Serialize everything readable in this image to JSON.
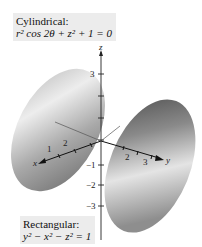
{
  "figure": {
    "top_label": {
      "title": "Cylindrical:",
      "equation": "r² cos 2θ + z² + 1 = 0"
    },
    "bottom_label": {
      "title": "Rectangular:",
      "equation": "y² − x² − z² = 1"
    },
    "axes": {
      "x_label": "x",
      "y_label": "y",
      "z_label": "z",
      "z_ticks": [
        "3",
        "−1",
        "−2",
        "−3"
      ],
      "x_ticks": [
        "1",
        "2"
      ],
      "y_ticks": [
        "2",
        "3"
      ]
    },
    "surface": "hyperboloid of two sheets",
    "colors": {
      "surface_light": "#e8e8e8",
      "surface_dark": "#5a5a5a",
      "axis": "#222222",
      "label_bg": "#ececec"
    }
  }
}
